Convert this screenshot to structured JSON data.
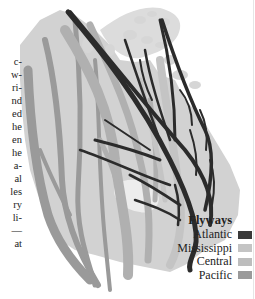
{
  "map": {
    "subject": "North American bird migration flyways",
    "region": "North America"
  },
  "body_text": {
    "lines": [
      "c-",
      "w-",
      "ri-",
      "nd",
      "ed",
      "he",
      "en",
      "he",
      "a-",
      "al",
      "les",
      "ry",
      "li-",
      "—",
      "at"
    ]
  },
  "legend": {
    "title": "Flyways",
    "items": [
      {
        "label": "Atlantic",
        "color": "#3a3a3a"
      },
      {
        "label": "Mississippi",
        "color": "#c4c4c4"
      },
      {
        "label": "Central",
        "color": "#bdbdbd"
      },
      {
        "label": "Pacific",
        "color": "#9a9a9a"
      }
    ]
  },
  "colors": {
    "land": "#cfcfcf",
    "land_light": "#dedede",
    "pacific": "#9a9a9a",
    "central": "#b4b4b4",
    "atlantic": "#2b2b2b"
  }
}
